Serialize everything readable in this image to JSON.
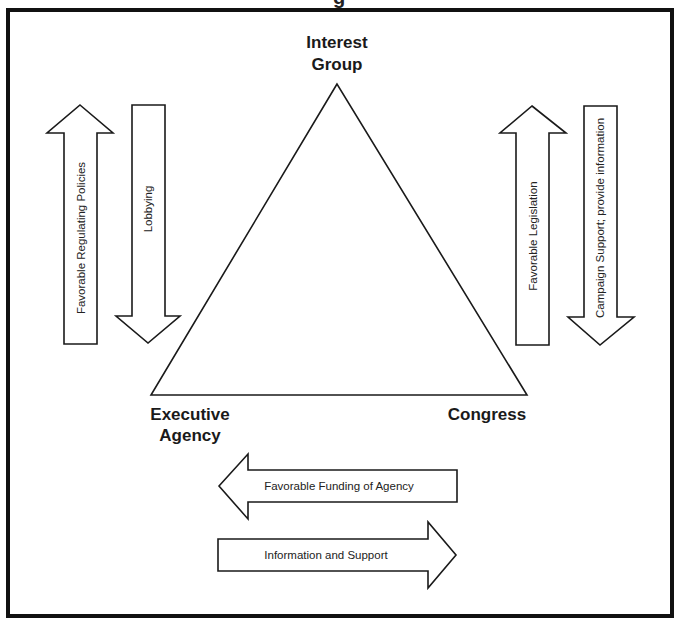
{
  "diagram": {
    "title_fragment": "g",
    "colors": {
      "stroke": "#1a1a1a",
      "frame": "#111111",
      "fill": "#ffffff",
      "text": "#1a1a1a"
    },
    "nodes": {
      "interest_group": {
        "line1": "Interest",
        "line2": "Group"
      },
      "executive_agency": {
        "line1": "Executive",
        "line2": "Agency"
      },
      "congress": {
        "line1": "Congress"
      }
    },
    "arrows": {
      "favorable_regulating_policies": {
        "label": "Favorable Regulating Policies",
        "direction": "up",
        "from": "Executive Agency",
        "to": "Interest Group"
      },
      "lobbying": {
        "label": "Lobbying",
        "direction": "down",
        "from": "Interest Group",
        "to": "Executive Agency"
      },
      "favorable_legislation": {
        "label": "Favorable Legislation",
        "direction": "up",
        "from": "Congress",
        "to": "Interest Group"
      },
      "campaign_support": {
        "label": "Campaign Support; provide information",
        "direction": "down",
        "from": "Interest Group",
        "to": "Congress"
      },
      "favorable_funding": {
        "label": "Favorable Funding of Agency",
        "direction": "left",
        "from": "Congress",
        "to": "Executive Agency"
      },
      "information_support": {
        "label": "Information and Support",
        "direction": "right",
        "from": "Executive Agency",
        "to": "Congress"
      }
    }
  }
}
